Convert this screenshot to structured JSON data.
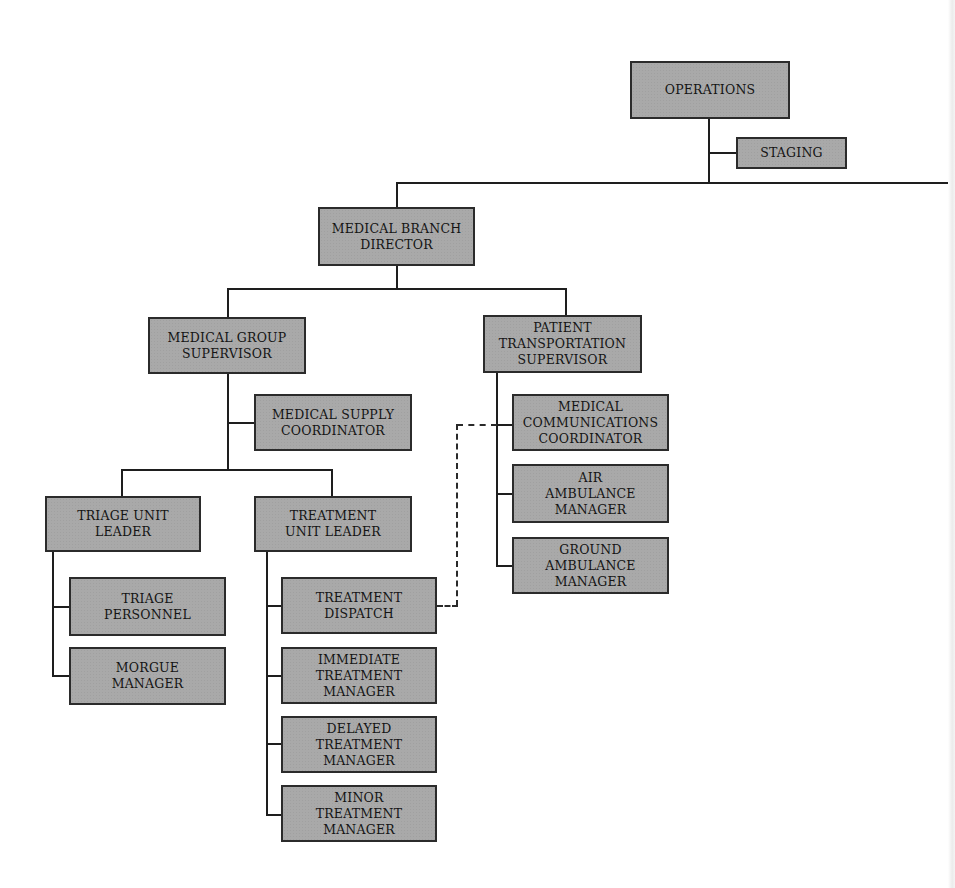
{
  "diagram": {
    "type": "org-chart",
    "nodes": {
      "operations": "OPERATIONS",
      "staging": "STAGING",
      "medical_branch_director": "MEDICAL BRANCH\nDIRECTOR",
      "medical_group_supervisor": "MEDICAL GROUP\nSUPERVISOR",
      "patient_transportation_supervisor": "PATIENT\nTRANSPORTATION\nSUPERVISOR",
      "medical_supply_coordinator": "MEDICAL SUPPLY\nCOORDINATOR",
      "medical_communications_coordinator": "MEDICAL\nCOMMUNICATIONS\nCOORDINATOR",
      "air_ambulance_manager": "AIR\nAMBULANCE\nMANAGER",
      "ground_ambulance_manager": "GROUND\nAMBULANCE\nMANAGER",
      "triage_unit_leader": "TRIAGE UNIT\nLEADER",
      "treatment_unit_leader": "TREATMENT\nUNIT LEADER",
      "triage_personnel": "TRIAGE\nPERSONNEL",
      "morgue_manager": "MORGUE\nMANAGER",
      "treatment_dispatch": "TREATMENT\nDISPATCH",
      "immediate_treatment_manager": "IMMEDIATE\nTREATMENT\nMANAGER",
      "delayed_treatment_manager": "DELAYED\nTREATMENT\nMANAGER",
      "minor_treatment_manager": "MINOR\nTREATMENT\nMANAGER"
    },
    "edges": [
      {
        "from": "OPERATIONS",
        "to": "STAGING",
        "style": "solid"
      },
      {
        "from": "OPERATIONS",
        "to": "MEDICAL BRANCH DIRECTOR",
        "style": "solid"
      },
      {
        "from": "MEDICAL BRANCH DIRECTOR",
        "to": "MEDICAL GROUP SUPERVISOR",
        "style": "solid"
      },
      {
        "from": "MEDICAL BRANCH DIRECTOR",
        "to": "PATIENT TRANSPORTATION SUPERVISOR",
        "style": "solid"
      },
      {
        "from": "MEDICAL GROUP SUPERVISOR",
        "to": "MEDICAL SUPPLY COORDINATOR",
        "style": "solid"
      },
      {
        "from": "MEDICAL GROUP SUPERVISOR",
        "to": "TRIAGE UNIT LEADER",
        "style": "solid"
      },
      {
        "from": "MEDICAL GROUP SUPERVISOR",
        "to": "TREATMENT UNIT LEADER",
        "style": "solid"
      },
      {
        "from": "TRIAGE UNIT LEADER",
        "to": "TRIAGE PERSONNEL",
        "style": "solid"
      },
      {
        "from": "TRIAGE UNIT LEADER",
        "to": "MORGUE MANAGER",
        "style": "solid"
      },
      {
        "from": "TREATMENT UNIT LEADER",
        "to": "TREATMENT DISPATCH",
        "style": "solid"
      },
      {
        "from": "TREATMENT UNIT LEADER",
        "to": "IMMEDIATE TREATMENT MANAGER",
        "style": "solid"
      },
      {
        "from": "TREATMENT UNIT LEADER",
        "to": "DELAYED TREATMENT MANAGER",
        "style": "solid"
      },
      {
        "from": "TREATMENT UNIT LEADER",
        "to": "MINOR TREATMENT MANAGER",
        "style": "solid"
      },
      {
        "from": "PATIENT TRANSPORTATION SUPERVISOR",
        "to": "MEDICAL COMMUNICATIONS COORDINATOR",
        "style": "solid"
      },
      {
        "from": "PATIENT TRANSPORTATION SUPERVISOR",
        "to": "AIR AMBULANCE MANAGER",
        "style": "solid"
      },
      {
        "from": "PATIENT TRANSPORTATION SUPERVISOR",
        "to": "GROUND AMBULANCE MANAGER",
        "style": "solid"
      },
      {
        "from": "TREATMENT DISPATCH",
        "to": "MEDICAL COMMUNICATIONS COORDINATOR",
        "style": "dashed"
      }
    ],
    "colors": {
      "box_fill": "#a9a9a9",
      "box_border": "#2b2b2b",
      "line": "#1e1e1e",
      "background": "#ffffff"
    }
  }
}
